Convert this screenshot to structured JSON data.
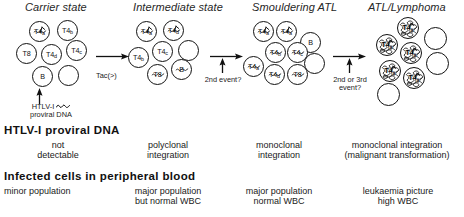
{
  "figure": {
    "kind": "htlv1-atl-progression-diagram",
    "stages": [
      {
        "id": "carrier",
        "title": "Carrier state",
        "dna_status": "not\ndetectable",
        "dna_line1": "not",
        "dna_line2": "detectable",
        "blood_line1": "minor population",
        "blood_line2": ""
      },
      {
        "id": "intermediate",
        "title": "Intermediate state",
        "dna_line1": "polyclonal",
        "dna_line2": "integration",
        "blood_line1": "major population",
        "blood_line2": "but normal WBC"
      },
      {
        "id": "smouldering",
        "title": "Smouldering ATL",
        "dna_line1": "monoclonal",
        "dna_line2": "integration",
        "blood_line1": "major population",
        "blood_line2": "normal WBC"
      },
      {
        "id": "atl",
        "title": "ATL/Lymphoma",
        "dna_line1": "monoclonal integration",
        "dna_line2": "(malignant transformation)",
        "blood_line1": "leukaemia picture",
        "blood_line2": "high WBC"
      }
    ],
    "transitions": [
      {
        "id": "t1",
        "label_line1": "Tac(>)",
        "label_line2": ""
      },
      {
        "id": "t2",
        "label_line1": "2nd event?",
        "label_line2": ""
      },
      {
        "id": "t3",
        "label_line1": "2nd or 3rd",
        "label_line2": "event?"
      }
    ],
    "infection_note": {
      "line1_prefix": "HTLV-I",
      "line1_glyph": "squiggle",
      "line2": "proviral DNA"
    },
    "sections": [
      {
        "id": "proviral",
        "title": "HTLV-I proviral DNA"
      },
      {
        "id": "blood",
        "title": "Infected cells in peripheral blood"
      }
    ],
    "clusters": {
      "carrier": [
        {
          "label": "T4",
          "sub": "a",
          "x": 13,
          "y": 1,
          "d": 21,
          "infected": true,
          "antenna": true
        },
        {
          "label": "T4",
          "sub": "b",
          "x": 41,
          "y": 0,
          "d": 21,
          "infected": false,
          "antenna": false
        },
        {
          "label": "T8",
          "sub": "",
          "x": 0,
          "y": 23,
          "d": 21,
          "infected": false,
          "antenna": false
        },
        {
          "label": "T4",
          "sub": "d",
          "x": 25,
          "y": 24,
          "d": 21,
          "infected": false,
          "antenna": false
        },
        {
          "label": "T4",
          "sub": "c",
          "x": 50,
          "y": 20,
          "d": 21,
          "infected": false,
          "antenna": false
        },
        {
          "label": "B",
          "sub": "",
          "x": 16,
          "y": 46,
          "d": 21,
          "infected": false,
          "antenna": false
        },
        {
          "label": "",
          "sub": "",
          "x": 42,
          "y": 45,
          "d": 21,
          "infected": false,
          "antenna": false
        }
      ],
      "intermediate": [
        {
          "label": "T4",
          "sub": "a",
          "x": 8,
          "y": 1,
          "d": 21,
          "infected": true,
          "antenna": true
        },
        {
          "label": "T4",
          "sub": "d",
          "x": 35,
          "y": 0,
          "d": 21,
          "infected": true,
          "antenna": true
        },
        {
          "label": "T4",
          "sub": "b",
          "x": 0,
          "y": 27,
          "d": 21,
          "infected": false,
          "antenna": false
        },
        {
          "label": "T4",
          "sub": "c",
          "x": 24,
          "y": 21,
          "d": 21,
          "infected": false,
          "antenna": false
        },
        {
          "label": "",
          "sub": "",
          "x": 50,
          "y": 20,
          "d": 21,
          "infected": false,
          "antenna": false
        },
        {
          "label": "T8",
          "sub": "",
          "x": 19,
          "y": 44,
          "d": 21,
          "infected": true,
          "antenna": false
        },
        {
          "label": "B",
          "sub": "",
          "x": 43,
          "y": 39,
          "d": 21,
          "infected": true,
          "antenna": false
        }
      ],
      "smouldering": [
        {
          "label": "T4",
          "sub": "a",
          "x": 10,
          "y": 1,
          "d": 21,
          "infected": true,
          "antenna": true
        },
        {
          "label": "T4",
          "sub": "a",
          "x": 33,
          "y": 1,
          "d": 21,
          "infected": true,
          "antenna": true
        },
        {
          "label": "B",
          "sub": "",
          "x": 57,
          "y": 12,
          "d": 21,
          "infected": false,
          "antenna": false
        },
        {
          "label": "T4",
          "sub": "b",
          "x": 22,
          "y": 22,
          "d": 21,
          "infected": true,
          "antenna": false
        },
        {
          "label": "T4",
          "sub": "c",
          "x": 44,
          "y": 22,
          "d": 21,
          "infected": true,
          "antenna": false
        },
        {
          "label": "",
          "sub": "",
          "x": 61,
          "y": 33,
          "d": 21,
          "infected": false,
          "antenna": false
        },
        {
          "label": "T4",
          "sub": "a",
          "x": 0,
          "y": 36,
          "d": 21,
          "infected": true,
          "antenna": false
        },
        {
          "label": "T4",
          "sub": "d",
          "x": 21,
          "y": 44,
          "d": 21,
          "infected": true,
          "antenna": false
        },
        {
          "label": "T8",
          "sub": "",
          "x": 44,
          "y": 44,
          "d": 21,
          "infected": true,
          "antenna": false
        }
      ],
      "atl": [
        {
          "label": "T4",
          "sub": "a",
          "x": 26,
          "y": 0,
          "d": 22,
          "malignant": true,
          "antenna": true
        },
        {
          "label": "",
          "sub": "",
          "x": 53,
          "y": 10,
          "d": 23,
          "malignant": false,
          "antenna": false
        },
        {
          "label": "T4",
          "sub": "a",
          "x": 5,
          "y": 17,
          "d": 22,
          "malignant": true,
          "antenna": true
        },
        {
          "label": "T4",
          "sub": "a",
          "x": 29,
          "y": 25,
          "d": 22,
          "malignant": true,
          "antenna": true
        },
        {
          "label": "",
          "sub": "",
          "x": 55,
          "y": 35,
          "d": 23,
          "malignant": false,
          "antenna": false
        },
        {
          "label": "T4",
          "sub": "a",
          "x": 8,
          "y": 43,
          "d": 22,
          "malignant": true,
          "antenna": true
        },
        {
          "label": "T4",
          "sub": "a",
          "x": 32,
          "y": 50,
          "d": 22,
          "malignant": true,
          "antenna": true
        },
        {
          "label": "",
          "sub": "",
          "x": 6,
          "y": 66,
          "d": 23,
          "malignant": false,
          "antenna": false
        }
      ]
    }
  }
}
